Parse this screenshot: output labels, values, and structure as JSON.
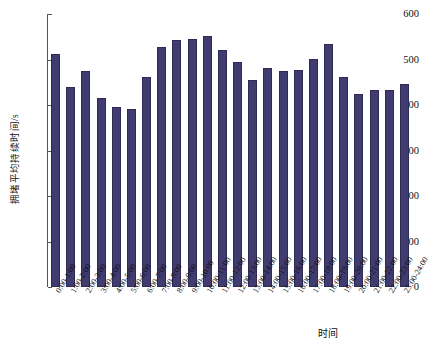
{
  "chart_data": {
    "type": "bar",
    "title": "",
    "xlabel": "时间",
    "ylabel": "拥堵平均持续时间/s",
    "ylim": [
      0,
      600
    ],
    "ytick_step": 100,
    "yticks": [
      600,
      500,
      400,
      300,
      200,
      100,
      0
    ],
    "grid": false,
    "legend": null,
    "bar_color": "#413c70",
    "bar_edge_color": "#2e2a55",
    "categories": [
      "0:00-1:00",
      "1:00-2:00",
      "2:00-3:00",
      "3:00-4:00",
      "4:00-5:00",
      "5:00-6:00",
      "6:00-7:00",
      "7:00-8:00",
      "8:00-9:00",
      "9:00-10:00",
      "10:00-11:00",
      "11:00-12:00",
      "12:00-13:00",
      "13:00-14:00",
      "14:00-15:00",
      "15:00-16:00",
      "16:00-17:00",
      "17:00-18:00",
      "18:00-19:00",
      "19:00-20:00",
      "20:00-21:00",
      "21:00-22:00",
      "22:00-23:00",
      "23:00-24:00"
    ],
    "values": [
      513,
      440,
      475,
      415,
      396,
      392,
      461,
      527,
      543,
      546,
      552,
      521,
      494,
      456,
      482,
      474,
      477,
      501,
      535,
      462,
      425,
      434,
      433,
      446
    ]
  }
}
